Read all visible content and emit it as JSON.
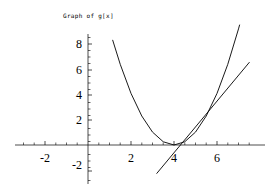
{
  "figure": {
    "title": "Graph of g[x]",
    "background_color": "#ffffff",
    "axis_color": "#000000",
    "curve_color": "#000000",
    "width": 272,
    "height": 190
  },
  "chart_data": {
    "type": "line",
    "title": "Graph of g[x]",
    "xlabel": "",
    "ylabel": "",
    "xlim": [
      -3.4,
      7.8
    ],
    "ylim": [
      -3.2,
      9.2
    ],
    "grid": false,
    "legend": "none",
    "x_ticks": [
      -2,
      2,
      4,
      6
    ],
    "x_tick_labels": [
      "-2",
      "2",
      "4",
      "6"
    ],
    "y_ticks": [
      -2,
      2,
      4,
      6,
      8
    ],
    "y_tick_labels": [
      "-2",
      "2",
      "4",
      "6",
      "8"
    ],
    "x_minor_tick_step": 0.5,
    "y_minor_tick_step": 0.5,
    "series": [
      {
        "name": "g[x]",
        "kind": "parabola",
        "expression": "(x - 4)^2",
        "vertex": [
          4,
          0
        ],
        "x_range": [
          1.15,
          7.6
        ],
        "points": [
          [
            1.15,
            8.12
          ],
          [
            1.5,
            6.25
          ],
          [
            2.0,
            4.0
          ],
          [
            2.5,
            2.25
          ],
          [
            3.0,
            1.0
          ],
          [
            3.5,
            0.25
          ],
          [
            4.0,
            0.0
          ],
          [
            4.5,
            0.25
          ],
          [
            5.0,
            1.0
          ],
          [
            5.5,
            2.25
          ],
          [
            6.0,
            4.0
          ],
          [
            6.5,
            6.25
          ],
          [
            7.0,
            9.0
          ],
          [
            7.05,
            9.3
          ]
        ]
      },
      {
        "name": "tangent",
        "kind": "line",
        "expression": "2 x - 8.6",
        "slope": 2.0,
        "intercept": -8.6,
        "x_range": [
          3.2,
          7.5
        ],
        "points": [
          [
            3.2,
            -2.2
          ],
          [
            7.5,
            6.4
          ]
        ]
      }
    ]
  },
  "ticks": {
    "x": [
      {
        "value": -2,
        "label": "-2",
        "px": 45,
        "py": 158
      },
      {
        "value": 2,
        "label": "2",
        "px": 131,
        "py": 158
      },
      {
        "value": 4,
        "label": "4",
        "px": 174,
        "py": 158
      },
      {
        "value": 6,
        "label": "6",
        "px": 217,
        "py": 158
      }
    ],
    "y": [
      {
        "value": 8,
        "label": "8",
        "px": 79,
        "py": 44
      },
      {
        "value": 6,
        "label": "6",
        "px": 79,
        "py": 70
      },
      {
        "value": 4,
        "label": "4",
        "px": 79,
        "py": 95
      },
      {
        "value": 2,
        "label": "2",
        "px": 79,
        "py": 120
      },
      {
        "value": -2,
        "label": "-2",
        "px": 79,
        "py": 170
      }
    ]
  }
}
